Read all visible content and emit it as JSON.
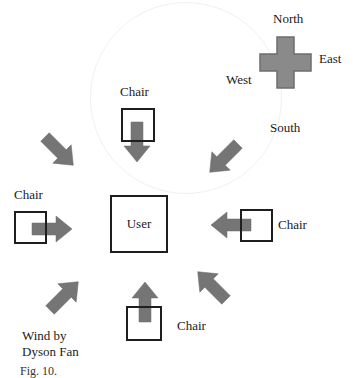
{
  "figure": {
    "compass": {
      "north": "North",
      "east": "East",
      "west": "West",
      "south": "South",
      "fill_color": "#8a8a8a",
      "stroke_color": "#6e6e6e"
    },
    "center": {
      "label": "User"
    },
    "chairs": [
      {
        "position": "top",
        "label": "Chair"
      },
      {
        "position": "left",
        "label": "Chair"
      },
      {
        "position": "right",
        "label": "Chair"
      },
      {
        "position": "bottom",
        "label": "Chair"
      }
    ],
    "wind_label": {
      "line1": "Wind by",
      "line2": "Dyson Fan"
    },
    "arrow_color": "#757575",
    "caption": "Fig. 10."
  }
}
